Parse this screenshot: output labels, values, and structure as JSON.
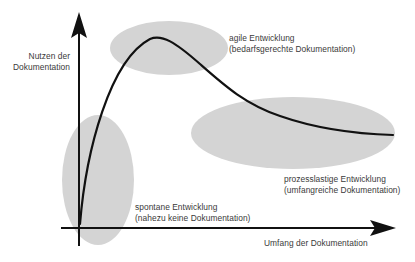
{
  "diagram": {
    "y_axis": {
      "label_line1": "Nutzen der",
      "label_line2": "Dokumentation"
    },
    "x_axis": {
      "label": "Umfang der Dokumentation"
    },
    "regions": [
      {
        "id": "spontaneous",
        "title": "spontane Entwicklung",
        "subtitle": "(nahezu keine Dokumentation)",
        "ellipse": {
          "cx": 98,
          "cy": 180,
          "rx": 36,
          "ry": 65
        }
      },
      {
        "id": "agile",
        "title": "agile Entwicklung",
        "subtitle": "(bedarfsgerechte Dokumentation)",
        "ellipse": {
          "cx": 169,
          "cy": 48,
          "rx": 59,
          "ry": 27
        }
      },
      {
        "id": "process-heavy",
        "title": "prozesslastige Entwicklung",
        "subtitle": "(umfangreiche Dokumentation)",
        "ellipse": {
          "cx": 293,
          "cy": 133,
          "rx": 102,
          "ry": 36
        }
      }
    ],
    "colors": {
      "ellipse_fill": "#d4d4d4",
      "line": "#111111",
      "text": "#3a3a3a",
      "background": "#ffffff"
    }
  }
}
